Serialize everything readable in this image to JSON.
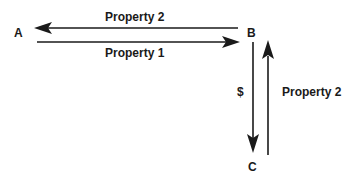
{
  "diagram": {
    "type": "flow",
    "nodes": [
      {
        "id": "A",
        "label": "A"
      },
      {
        "id": "B",
        "label": "B"
      },
      {
        "id": "C",
        "label": "C"
      }
    ],
    "edges": [
      {
        "from": "B",
        "to": "A",
        "label": "Property 2"
      },
      {
        "from": "A",
        "to": "B",
        "label": "Property 1"
      },
      {
        "from": "B",
        "to": "C",
        "label": "$"
      },
      {
        "from": "C",
        "to": "B",
        "label": "Property 2"
      }
    ],
    "colors": {
      "ink": "#1a1a1a",
      "background": "#ffffff"
    }
  }
}
